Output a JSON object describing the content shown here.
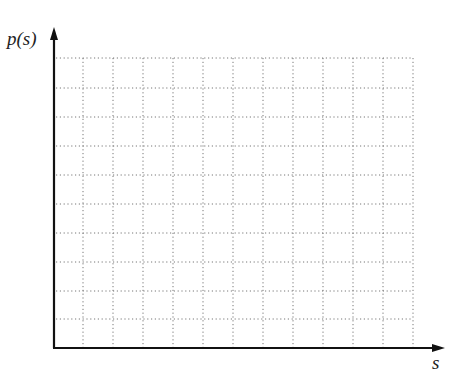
{
  "diagram": {
    "y_axis_label": "p(s)",
    "x_axis_label": "s",
    "grid": {
      "columns": 12,
      "rows": 10,
      "style": "dotted"
    },
    "colors": {
      "axis": "#111111",
      "grid": "#777777",
      "background": "#ffffff"
    }
  }
}
